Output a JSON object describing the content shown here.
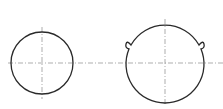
{
  "drawing": {
    "type": "technical-drawing",
    "stroke_color": "#2a2a2a",
    "centerline_color": "#8a8a8a",
    "left_circle": {
      "cx": 42,
      "cy": 63,
      "r": 31
    },
    "right_shape": {
      "cx": 165,
      "cy": 63,
      "r": 39,
      "bumps": [
        {
          "x": 128,
          "y": 43
        },
        {
          "x": 202,
          "y": 43
        }
      ]
    },
    "horizontal_centerline": {
      "y": 63,
      "x1": 8,
      "x2": 223
    }
  }
}
